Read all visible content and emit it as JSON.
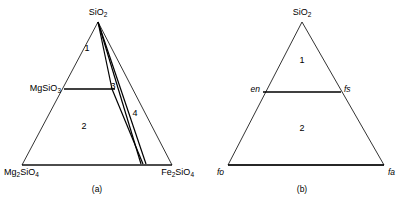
{
  "figure": {
    "kind": "ternary-phase-diagram-pair",
    "background_color": "#ffffff",
    "line_color": "#000000",
    "panels": [
      {
        "id": "a",
        "caption": "(a)",
        "caption_x": 97,
        "caption_y": 184,
        "triangle": {
          "apex": {
            "x": 98,
            "y": 22
          },
          "bottom_left": {
            "x": 22,
            "y": 165
          },
          "bottom_right": {
            "x": 172,
            "y": 165
          },
          "stroke_width": 0.8
        },
        "vertex_labels": [
          {
            "name": "apex-label",
            "html": "SiO<sub>2</sub>",
            "x": 98,
            "y": 8,
            "align": "center",
            "italic": false
          },
          {
            "name": "bottom-left-label",
            "html": "Mg<sub>2</sub>SiO<sub>4</sub>",
            "x": 4,
            "y": 168,
            "align": "left",
            "italic": false
          },
          {
            "name": "bottom-right-label",
            "html": "Fe<sub>2</sub>SiO<sub>4</sub>",
            "x": 194,
            "y": 168,
            "align": "right",
            "italic": false
          }
        ],
        "side_labels": [
          {
            "name": "mgsio3-label",
            "html": "MgSiO<sub>3</sub>",
            "x": 61,
            "y": 84,
            "align": "right",
            "italic": false
          }
        ],
        "join_lines": [
          {
            "name": "enstatite-join",
            "x1": 64,
            "y1": 89,
            "x2": 115,
            "y2": 89,
            "stroke_width": 1.6
          },
          {
            "name": "olivine-base-join",
            "x1": 22,
            "y1": 165,
            "x2": 172,
            "y2": 165,
            "stroke_width": 1.0
          }
        ],
        "tie_lines": [
          {
            "name": "tie-line-left",
            "x1": 98,
            "y1": 22,
            "x2": 112,
            "y2": 89,
            "stroke_width": 1.2
          },
          {
            "name": "tie-line-middle",
            "x1": 98,
            "y1": 22,
            "x2": 141,
            "y2": 164,
            "stroke_width": 1.2
          },
          {
            "name": "tie-line-right",
            "x1": 98,
            "y1": 22,
            "x2": 146,
            "y2": 164,
            "stroke_width": 1.2
          },
          {
            "name": "tie-line-lower",
            "x1": 112,
            "y1": 89,
            "x2": 143,
            "y2": 164,
            "stroke_width": 1.2
          }
        ],
        "region_numbers": [
          {
            "name": "region-1",
            "label": "1",
            "x": 87,
            "y": 48
          },
          {
            "name": "region-2",
            "label": "2",
            "x": 84,
            "y": 126
          },
          {
            "name": "region-3",
            "label": "3",
            "x": 113,
            "y": 86
          },
          {
            "name": "region-4",
            "label": "4",
            "x": 135,
            "y": 113
          }
        ]
      },
      {
        "id": "b",
        "caption": "(b)",
        "caption_x": 302,
        "caption_y": 184,
        "triangle": {
          "apex": {
            "x": 302,
            "y": 22
          },
          "bottom_left": {
            "x": 228,
            "y": 165
          },
          "bottom_right": {
            "x": 384,
            "y": 165
          },
          "stroke_width": 0.8
        },
        "vertex_labels": [
          {
            "name": "apex-label",
            "html": "SiO<sub>2</sub>",
            "x": 302,
            "y": 8,
            "align": "center",
            "italic": false
          },
          {
            "name": "bottom-left-label",
            "html": "fo",
            "x": 217,
            "y": 168,
            "align": "left",
            "italic": true
          },
          {
            "name": "bottom-right-label",
            "html": "fa",
            "x": 395,
            "y": 168,
            "align": "right",
            "italic": true
          }
        ],
        "side_labels": [
          {
            "name": "enstatite-label",
            "html": "en",
            "x": 260,
            "y": 85,
            "align": "right",
            "italic": true
          },
          {
            "name": "ferrosilite-label",
            "html": "fs",
            "x": 344,
            "y": 85,
            "align": "left",
            "italic": true
          }
        ],
        "join_lines": [
          {
            "name": "pyroxene-join",
            "x1": 263,
            "y1": 92,
            "x2": 341,
            "y2": 92,
            "stroke_width": 1.6
          },
          {
            "name": "olivine-base-join",
            "x1": 228,
            "y1": 165,
            "x2": 384,
            "y2": 165,
            "stroke_width": 1.4
          }
        ],
        "tie_lines": [],
        "region_numbers": [
          {
            "name": "region-1",
            "label": "1",
            "x": 302,
            "y": 60
          },
          {
            "name": "region-2",
            "label": "2",
            "x": 302,
            "y": 128
          }
        ]
      }
    ]
  }
}
